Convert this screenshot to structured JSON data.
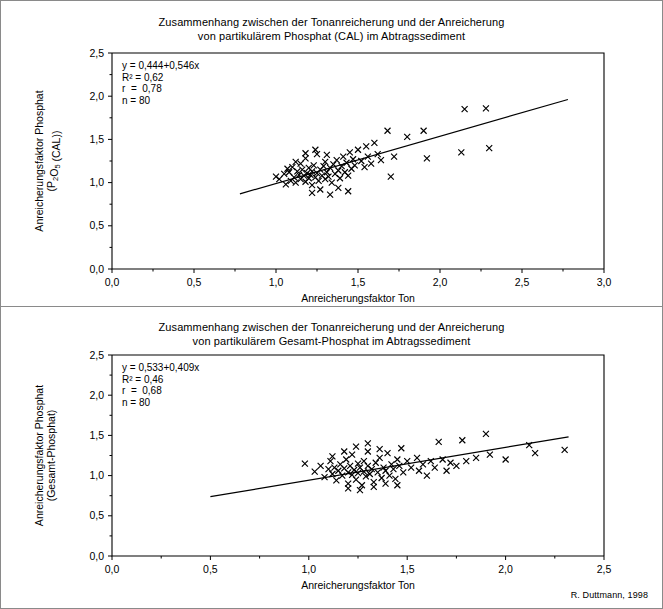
{
  "credit": "R. Duttmann, 1998",
  "charts": [
    {
      "id": "cal",
      "title_line1": "Zusammenhang zwischen der Tonanreicherung und der Anreicherung",
      "title_line2": "von partikulärem Phosphat (CAL) im Abtragssediment",
      "stats": {
        "equation": "y = 0,444+0,546x",
        "r2": "R² = 0,62",
        "r": "r  =  0,78",
        "n": "n = 80"
      },
      "chart_data": {
        "type": "scatter",
        "title": "Zusammenhang zwischen der Tonanreicherung und der Anreicherung von partikulärem Phosphat (CAL) im Abtragssediment",
        "xlabel": "Anreicherungsfaktor Ton",
        "ylabel": "Anreicherungsfaktor Phosphat (P2O5 (CAL))",
        "xlim": [
          0.0,
          3.0
        ],
        "ylim": [
          0.0,
          2.5
        ],
        "xticks": [
          "0,0",
          "0,5",
          "1,0",
          "1,5",
          "2,0",
          "2,5",
          "3,0"
        ],
        "yticks": [
          "0,0",
          "0,5",
          "1,0",
          "1,5",
          "2,0",
          "2,5"
        ],
        "xtick_values": [
          0.0,
          0.5,
          1.0,
          1.5,
          2.0,
          2.5,
          3.0
        ],
        "ytick_values": [
          0.0,
          0.5,
          1.0,
          1.5,
          2.0,
          2.5
        ],
        "grid": false,
        "legend": false,
        "n": 80,
        "fit": {
          "intercept": 0.444,
          "slope": 0.546,
          "r2": 0.62,
          "r": 0.78,
          "x_start": 0.78,
          "x_end": 2.78
        },
        "points": [
          [
            1.0,
            1.07
          ],
          [
            1.02,
            1.04
          ],
          [
            1.05,
            1.1
          ],
          [
            1.06,
            0.98
          ],
          [
            1.08,
            1.12
          ],
          [
            1.09,
            1.02
          ],
          [
            1.1,
            1.18
          ],
          [
            1.11,
            1.06
          ],
          [
            1.12,
            1.0
          ],
          [
            1.13,
            1.13
          ],
          [
            1.14,
            1.09
          ],
          [
            1.15,
            1.22
          ],
          [
            1.15,
            1.04
          ],
          [
            1.16,
            1.15
          ],
          [
            1.17,
            1.08
          ],
          [
            1.18,
            1.01
          ],
          [
            1.18,
            1.28
          ],
          [
            1.19,
            1.11
          ],
          [
            1.2,
            1.05
          ],
          [
            1.2,
            1.17
          ],
          [
            1.21,
            1.09
          ],
          [
            1.22,
            1.13
          ],
          [
            1.22,
            0.97
          ],
          [
            1.23,
            1.2
          ],
          [
            1.24,
            1.06
          ],
          [
            1.25,
            1.11
          ],
          [
            1.25,
            1.33
          ],
          [
            1.26,
            1.02
          ],
          [
            1.27,
            1.15
          ],
          [
            1.28,
            1.08
          ],
          [
            1.29,
            1.19
          ],
          [
            1.3,
            1.04
          ],
          [
            1.3,
            1.24
          ],
          [
            1.31,
            1.12
          ],
          [
            1.32,
            1.07
          ],
          [
            1.33,
            1.17
          ],
          [
            1.34,
            1.0
          ],
          [
            1.35,
            1.21
          ],
          [
            1.36,
            1.1
          ],
          [
            1.37,
            1.26
          ],
          [
            1.38,
            1.14
          ],
          [
            1.39,
            1.05
          ],
          [
            1.4,
            1.19
          ],
          [
            1.41,
            1.3
          ],
          [
            1.42,
            1.12
          ],
          [
            1.43,
            1.23
          ],
          [
            1.44,
            1.08
          ],
          [
            1.45,
            1.35
          ],
          [
            1.46,
            1.16
          ],
          [
            1.47,
            1.27
          ],
          [
            1.48,
            1.2
          ],
          [
            1.5,
            1.38
          ],
          [
            1.52,
            1.25
          ],
          [
            1.54,
            1.18
          ],
          [
            1.55,
            1.42
          ],
          [
            1.56,
            1.3
          ],
          [
            1.58,
            1.22
          ],
          [
            1.6,
            1.46
          ],
          [
            1.62,
            1.33
          ],
          [
            1.64,
            1.26
          ],
          [
            1.22,
            0.88
          ],
          [
            1.27,
            0.92
          ],
          [
            1.33,
            0.86
          ],
          [
            1.38,
            0.94
          ],
          [
            1.44,
            0.9
          ],
          [
            1.18,
            1.34
          ],
          [
            1.24,
            1.38
          ],
          [
            1.31,
            1.32
          ],
          [
            1.12,
            1.24
          ],
          [
            1.07,
            1.16
          ],
          [
            1.68,
            1.6
          ],
          [
            1.7,
            1.07
          ],
          [
            1.72,
            1.3
          ],
          [
            1.8,
            1.53
          ],
          [
            1.9,
            1.6
          ],
          [
            1.92,
            1.28
          ],
          [
            2.13,
            1.35
          ],
          [
            2.15,
            1.85
          ],
          [
            2.28,
            1.86
          ],
          [
            2.3,
            1.4
          ]
        ]
      }
    },
    {
      "id": "gesamt",
      "title_line1": "Zusammenhang zwischen der Tonanreicherung und der Anreicherung",
      "title_line2": "von partikulärem Gesamt-Phosphat im Abtragssediment",
      "stats": {
        "equation": "y = 0,533+0,409x",
        "r2": "R² = 0,46",
        "r": "r  =  0,68",
        "n": "n = 80"
      },
      "chart_data": {
        "type": "scatter",
        "title": "Zusammenhang zwischen der Tonanreicherung und der Anreicherung von partikulärem Gesamt-Phosphat im Abtragssediment",
        "xlabel": "Anreicherungsfaktor Ton",
        "ylabel": "Anreicherungsfaktor Phosphat (Gesamt-Phosphat)",
        "xlim": [
          0.0,
          2.5
        ],
        "ylim": [
          0.0,
          2.5
        ],
        "xticks": [
          "0,0",
          "0,5",
          "1,0",
          "1,5",
          "2,0",
          "2,5"
        ],
        "yticks": [
          "0,0",
          "0,5",
          "1,0",
          "1,5",
          "2,0",
          "2,5"
        ],
        "xtick_values": [
          0.0,
          0.5,
          1.0,
          1.5,
          2.0,
          2.5
        ],
        "ytick_values": [
          0.0,
          0.5,
          1.0,
          1.5,
          2.0,
          2.5
        ],
        "grid": false,
        "legend": false,
        "n": 80,
        "fit": {
          "intercept": 0.533,
          "slope": 0.409,
          "r2": 0.46,
          "r": 0.68,
          "x_start": 0.5,
          "x_end": 2.32
        },
        "points": [
          [
            0.98,
            1.15
          ],
          [
            1.03,
            1.05
          ],
          [
            1.06,
            1.12
          ],
          [
            1.08,
            0.98
          ],
          [
            1.1,
            1.08
          ],
          [
            1.11,
            1.18
          ],
          [
            1.12,
            1.02
          ],
          [
            1.13,
            1.1
          ],
          [
            1.14,
            0.94
          ],
          [
            1.15,
            1.06
          ],
          [
            1.16,
            1.14
          ],
          [
            1.17,
            1.0
          ],
          [
            1.18,
            1.09
          ],
          [
            1.19,
            1.2
          ],
          [
            1.2,
            1.04
          ],
          [
            1.2,
            0.9
          ],
          [
            1.21,
            1.12
          ],
          [
            1.22,
            1.01
          ],
          [
            1.22,
            1.26
          ],
          [
            1.23,
            1.07
          ],
          [
            1.24,
            0.95
          ],
          [
            1.25,
            1.15
          ],
          [
            1.25,
            1.03
          ],
          [
            1.26,
            1.1
          ],
          [
            1.27,
            0.88
          ],
          [
            1.28,
            1.18
          ],
          [
            1.28,
            1.05
          ],
          [
            1.29,
            0.99
          ],
          [
            1.3,
            1.12
          ],
          [
            1.3,
            1.3
          ],
          [
            1.31,
            1.02
          ],
          [
            1.32,
            1.08
          ],
          [
            1.33,
            0.92
          ],
          [
            1.34,
            1.16
          ],
          [
            1.35,
            1.04
          ],
          [
            1.36,
            1.22
          ],
          [
            1.37,
            0.97
          ],
          [
            1.38,
            1.1
          ],
          [
            1.39,
            1.06
          ],
          [
            1.4,
            1.28
          ],
          [
            1.41,
            1.0
          ],
          [
            1.42,
            1.14
          ],
          [
            1.43,
            1.08
          ],
          [
            1.44,
            0.96
          ],
          [
            1.45,
            1.2
          ],
          [
            1.46,
            1.12
          ],
          [
            1.47,
            1.34
          ],
          [
            1.48,
            1.04
          ],
          [
            1.5,
            1.18
          ],
          [
            1.52,
            1.1
          ],
          [
            1.24,
            1.36
          ],
          [
            1.3,
            1.4
          ],
          [
            1.36,
            1.33
          ],
          [
            1.18,
            1.3
          ],
          [
            1.12,
            1.24
          ],
          [
            1.2,
            0.84
          ],
          [
            1.26,
            0.82
          ],
          [
            1.33,
            0.86
          ],
          [
            1.39,
            0.9
          ],
          [
            1.45,
            0.88
          ],
          [
            1.55,
            1.22
          ],
          [
            1.56,
            1.06
          ],
          [
            1.58,
            1.14
          ],
          [
            1.6,
            1.0
          ],
          [
            1.62,
            1.18
          ],
          [
            1.64,
            1.1
          ],
          [
            1.66,
            1.42
          ],
          [
            1.68,
            1.2
          ],
          [
            1.7,
            1.06
          ],
          [
            1.72,
            1.16
          ],
          [
            1.75,
            1.12
          ],
          [
            1.78,
            1.44
          ],
          [
            1.8,
            1.18
          ],
          [
            1.85,
            1.22
          ],
          [
            1.9,
            1.52
          ],
          [
            1.92,
            1.26
          ],
          [
            2.0,
            1.2
          ],
          [
            2.12,
            1.38
          ],
          [
            2.15,
            1.28
          ],
          [
            2.3,
            1.32
          ]
        ]
      }
    }
  ]
}
